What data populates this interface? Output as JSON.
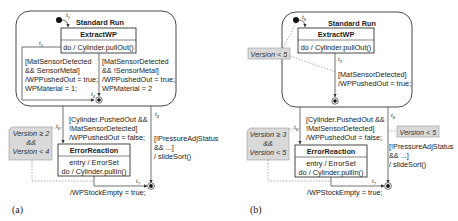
{
  "panels": [
    {
      "caption": "(a)",
      "composite_state": {
        "title": "Standard Run"
      },
      "states": {
        "extract": {
          "name": "ExtractWP",
          "actions": [
            "do / Cylinder.pullOut()"
          ]
        },
        "error": {
          "name": "ErrorReaction",
          "actions": [
            "entry / ErrorSet",
            "do / Cylinder.pullIn()"
          ]
        }
      },
      "transitions": {
        "t2": {
          "label": "t",
          "sub": "2"
        },
        "t3": {
          "label": "t",
          "sub": "3"
        },
        "t4": {
          "label": "t",
          "sub": "4"
        },
        "t6": {
          "label": "t",
          "sub": "6"
        },
        "t7": {
          "label": "t",
          "sub": "7"
        },
        "t8": {
          "label": "t",
          "sub": "8"
        }
      },
      "guards": {
        "left": [
          "[MatSensorDetected",
          "&& SensorMetal]",
          "/WPPushedOut = true;",
          "WPMaterial = 1;"
        ],
        "right": [
          "[MatSensorDetected",
          "&& !SensorMetal]",
          "/WPPushedOut = true;",
          "WPMaterial = 2"
        ],
        "t6": [
          "[Cylinder.PushedOut &&",
          "!MatSensorDetected]",
          "/WPPushedOut = false;"
        ],
        "t8": [
          "[!PressureAdjStatus",
          "&& ...]",
          "/ slideSort()"
        ],
        "t7": "/WPStockEmpty = true;"
      },
      "annotations": [
        {
          "lines": [
            "Version ≥ 2",
            "&&",
            "Version < 4"
          ]
        }
      ]
    },
    {
      "caption": "(b)",
      "composite_state": {
        "title": "Standard Run"
      },
      "states": {
        "extract": {
          "name": "ExtractWP",
          "actions": [
            "do / Cylinder.pullOut()"
          ]
        },
        "error": {
          "name": "ErrorReaction",
          "actions": [
            "entry / ErrorSet",
            "do / Cylinder.pullIn()"
          ]
        }
      },
      "transitions": {
        "t0": {
          "label": "t",
          "sub": "0"
        },
        "t9": {
          "label": "t",
          "sub": "9"
        },
        "t6": {
          "label": "t",
          "sub": "6"
        },
        "t7": {
          "label": "t",
          "sub": "7"
        },
        "t8": {
          "label": "t",
          "sub": "8"
        }
      },
      "guards": {
        "t9": [
          "[MatSensorDetected]",
          "/WPPushedOut = true;"
        ],
        "t6": [
          "[Cylinder.PushedOut &&",
          "!MatSensorDetected]",
          "/WPPushedOut = false;"
        ],
        "t8": [
          "[!PressureAdjStatus",
          "&& ...]",
          "/ slideSort()"
        ],
        "t7": "/WPStockEmpty = true;"
      },
      "annotations": [
        {
          "lines": [
            "Version < 5"
          ]
        },
        {
          "lines": [
            "Version ≥ 3",
            "&&",
            "Version < 5"
          ]
        },
        {
          "lines": [
            "Version < 5"
          ]
        }
      ]
    }
  ],
  "colors": {
    "line": "#333333",
    "note_fill": "#d9d9d9",
    "note_stroke": "#9a9a9a",
    "dashed": "#777777"
  }
}
